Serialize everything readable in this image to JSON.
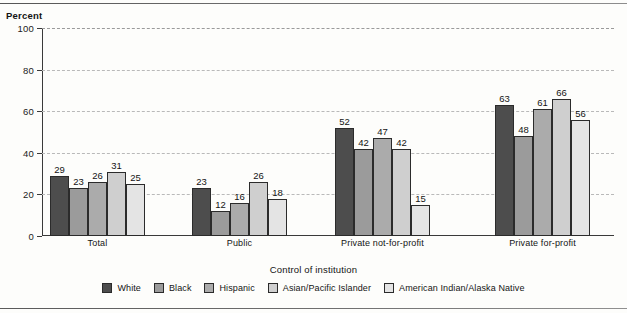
{
  "chart_data": {
    "type": "bar",
    "title": "",
    "xlabel": "Control of institution",
    "ylabel": "Percent",
    "ylim": [
      0,
      100
    ],
    "yticks": [
      0,
      20,
      40,
      60,
      80,
      100
    ],
    "grid": true,
    "legend_position": "bottom",
    "categories": [
      "Total",
      "Public",
      "Private not-for-profit",
      "Private for-profit"
    ],
    "series": [
      {
        "name": "White",
        "color": "#4d4d4d",
        "values": [
          29,
          23,
          52,
          63
        ]
      },
      {
        "name": "Black",
        "color": "#9b9b9b",
        "values": [
          23,
          12,
          42,
          48
        ]
      },
      {
        "name": "Hispanic",
        "color": "#ababab",
        "values": [
          26,
          16,
          47,
          61
        ]
      },
      {
        "name": "Asian/Pacific Islander",
        "color": "#cfcfcf",
        "values": [
          31,
          26,
          42,
          66
        ]
      },
      {
        "name": "American Indian/Alaska Native",
        "color": "#e4e4e4",
        "values": [
          25,
          18,
          15,
          56
        ]
      }
    ]
  },
  "axis": {
    "y_title": "Percent",
    "x_title": "Control of institution",
    "y_tick_labels": [
      "0",
      "20",
      "40",
      "60",
      "80",
      "100"
    ]
  }
}
